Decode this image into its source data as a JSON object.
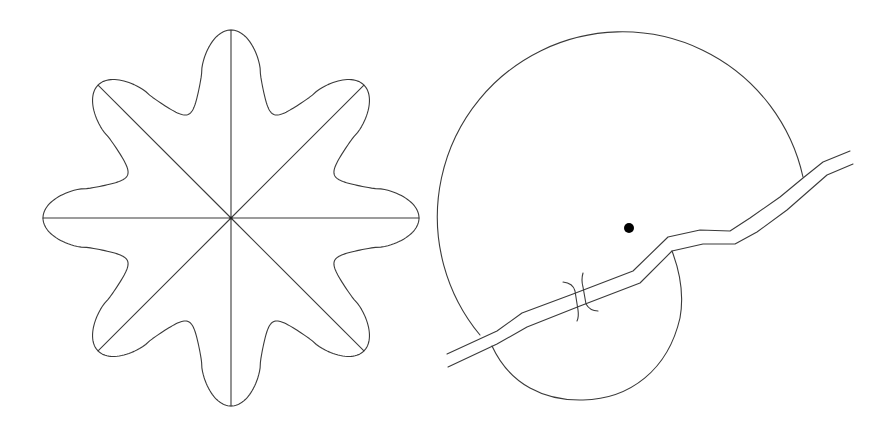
{
  "figures": [
    {
      "id": "left",
      "kind": "eight-pointed-star-with-radii",
      "center": [
        231,
        218
      ],
      "points": 8,
      "outer_radius": 188,
      "inner_radius": 112,
      "radii_lines": 8
    },
    {
      "id": "right",
      "kind": "circular-region-with-river-and-bridge",
      "dot": [
        629,
        228
      ],
      "stroke_color": "#3a3a3a",
      "dot_color": "#000000"
    }
  ],
  "colors": {
    "background": "#ffffff",
    "stroke": "#3a3a3a"
  }
}
